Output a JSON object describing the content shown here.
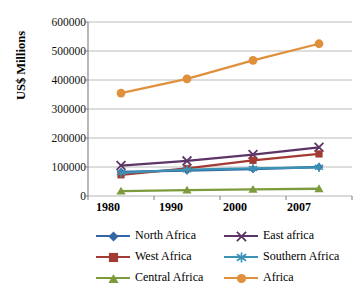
{
  "chart_data": {
    "type": "line",
    "title": "",
    "subtitle": "",
    "xlabel": "",
    "ylabel": "US$ Millions",
    "categories": [
      "1980",
      "1990",
      "2000",
      "2007"
    ],
    "x": [
      1980,
      1990,
      2000,
      2007
    ],
    "ylim": [
      0,
      600000
    ],
    "yticks": [
      "0",
      "100000",
      "200000",
      "300000",
      "400000",
      "500000",
      "600000"
    ],
    "ytick_values": [
      0,
      100000,
      200000,
      300000,
      400000,
      500000,
      600000
    ],
    "grid": true,
    "legend_position": "bottom",
    "series": [
      {
        "name": "North Africa",
        "color": "#3465a4",
        "marker": "diamond",
        "values": [
          83000,
          88000,
          93000,
          100000
        ]
      },
      {
        "name": "East africa",
        "color": "#5c3566",
        "marker": "x",
        "values": [
          105000,
          121000,
          143000,
          168000
        ]
      },
      {
        "name": "West Africa",
        "color": "#a33b34",
        "marker": "square",
        "values": [
          73000,
          95000,
          123000,
          145000
        ]
      },
      {
        "name": "Southern Africa",
        "color": "#3a92b5",
        "marker": "asterisk",
        "values": [
          80000,
          91000,
          95000,
          99000
        ]
      },
      {
        "name": "Central Africa",
        "color": "#7d9b3c",
        "marker": "triangle",
        "values": [
          17000,
          20000,
          23000,
          25000
        ]
      },
      {
        "name": "Africa",
        "color": "#e0903c",
        "marker": "circle",
        "values": [
          355000,
          404000,
          468000,
          525000
        ]
      }
    ]
  },
  "axis": {
    "y_label": "US$ Millions",
    "y_ticks": [
      "600000",
      "500000",
      "400000",
      "300000",
      "200000",
      "100000",
      "0"
    ],
    "x_ticks": [
      "1980",
      "1990",
      "2000",
      "2007"
    ]
  },
  "legend": {
    "items": [
      {
        "label": "North Africa",
        "color": "#3465a4",
        "marker": "diamond"
      },
      {
        "label": "East africa",
        "color": "#5c3566",
        "marker": "x"
      },
      {
        "label": "West Africa",
        "color": "#a33b34",
        "marker": "square"
      },
      {
        "label": "Southern Africa",
        "color": "#3a92b5",
        "marker": "asterisk"
      },
      {
        "label": "Central Africa",
        "color": "#7d9b3c",
        "marker": "triangle"
      },
      {
        "label": "Africa",
        "color": "#e0903c",
        "marker": "circle"
      }
    ]
  },
  "colors": {
    "gridline": "#b4b4b4",
    "axis": "#7f7f7f",
    "background": "#ffffff",
    "text": "#000000"
  }
}
